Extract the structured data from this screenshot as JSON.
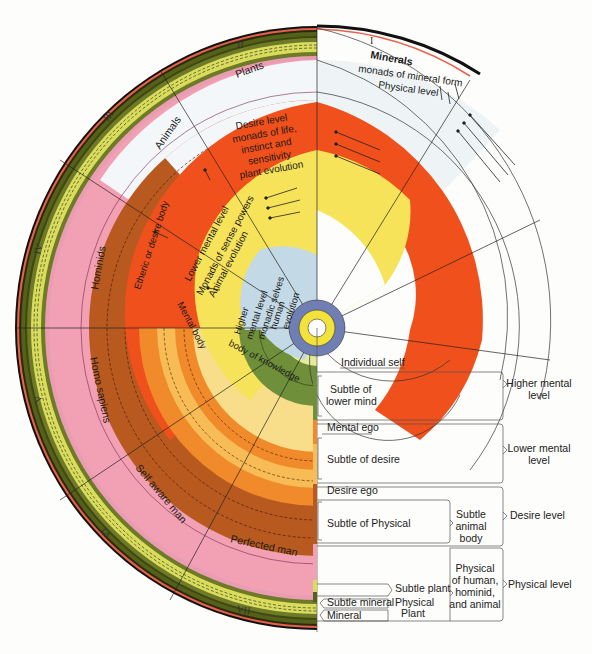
{
  "diagram": {
    "sector_numerals": [
      "I",
      "II",
      "III",
      "IV",
      "V",
      "VI",
      "VII"
    ],
    "kingdom_labels": {
      "minerals": "Minerals",
      "plants": "Plants",
      "animals": "Animals",
      "hominids": "Hominids",
      "homo_sapiens": "Homo sapiens",
      "self_aware_man": "Self aware man",
      "perfected_man": "Perfected man"
    },
    "band_labels": {
      "physical": [
        "monads of mineral form",
        "Physical level"
      ],
      "desire": [
        "Desire level",
        "monads of life,",
        "instinct and",
        "sensitivity",
        "plant evolution"
      ],
      "lower_mental": [
        "Lower mental level",
        "Monads of sense powers",
        "Animal evolution"
      ],
      "higher_mental": [
        "Higher",
        "mental level",
        "monadic selves",
        "human",
        "evolution"
      ],
      "etheric_body": "Etheric or desire body",
      "mental_body": "Mental body",
      "body_of_knowledge": "body of knowledge"
    },
    "colors": {
      "physical_white": "#eef3f6",
      "desire_red": "#f0501c",
      "lower_mental_yellow": "#f6e35a",
      "higher_mental_blue": "#c3d9e6",
      "core_blue": "#6f7fb4",
      "core_yellow": "#f3e13c",
      "pink": "#f2a0b4",
      "brown": "#b8591f",
      "orange": "#f08a2a",
      "light_orange": "#f7bc55",
      "pale_yellow": "#f8de8a",
      "olive_green": "#6f8f3a",
      "dark_olive": "#556019",
      "lime": "#d9dd5a"
    }
  },
  "legend": {
    "rows": [
      {
        "left": "Individual self",
        "right": "Higher mental level"
      },
      {
        "left": "Subtle of lower mind"
      },
      {
        "left": "Mental ego",
        "right": "Lower mental level"
      },
      {
        "left": "Subtle of desire"
      },
      {
        "left": "Desire ego",
        "right": "Desire level"
      },
      {
        "left": "Subtle of Physical",
        "middle": "Subtle animal body"
      },
      {
        "left": "Subtle plant",
        "middle": "Physical of human, hominid, and animal",
        "right": "Physical level"
      },
      {
        "left": "Subtle mineral",
        "middle2": "Physical Plant"
      },
      {
        "left": "Mineral"
      }
    ],
    "individual_self": "Individual self",
    "subtle_lower_mind": [
      "Subtle of",
      "lower mind"
    ],
    "mental_ego": "Mental ego",
    "subtle_desire": "Subtle of desire",
    "desire_ego": "Desire ego",
    "subtle_physical": "Subtle of Physical",
    "subtle_animal_body": [
      "Subtle",
      "animal",
      "body"
    ],
    "subtle_plant": "Subtle plant",
    "physical_plant": [
      "Physical",
      "Plant"
    ],
    "subtle_mineral": "Subtle mineral",
    "mineral": "Mineral",
    "physical_human": [
      "Physical",
      "of human,",
      "hominid,",
      "and animal"
    ],
    "higher_mental_level": [
      "Higher mental",
      "level"
    ],
    "lower_mental_level": [
      "Lower mental",
      "level"
    ],
    "desire_level": "Desire level",
    "physical_level": "Physical level"
  }
}
